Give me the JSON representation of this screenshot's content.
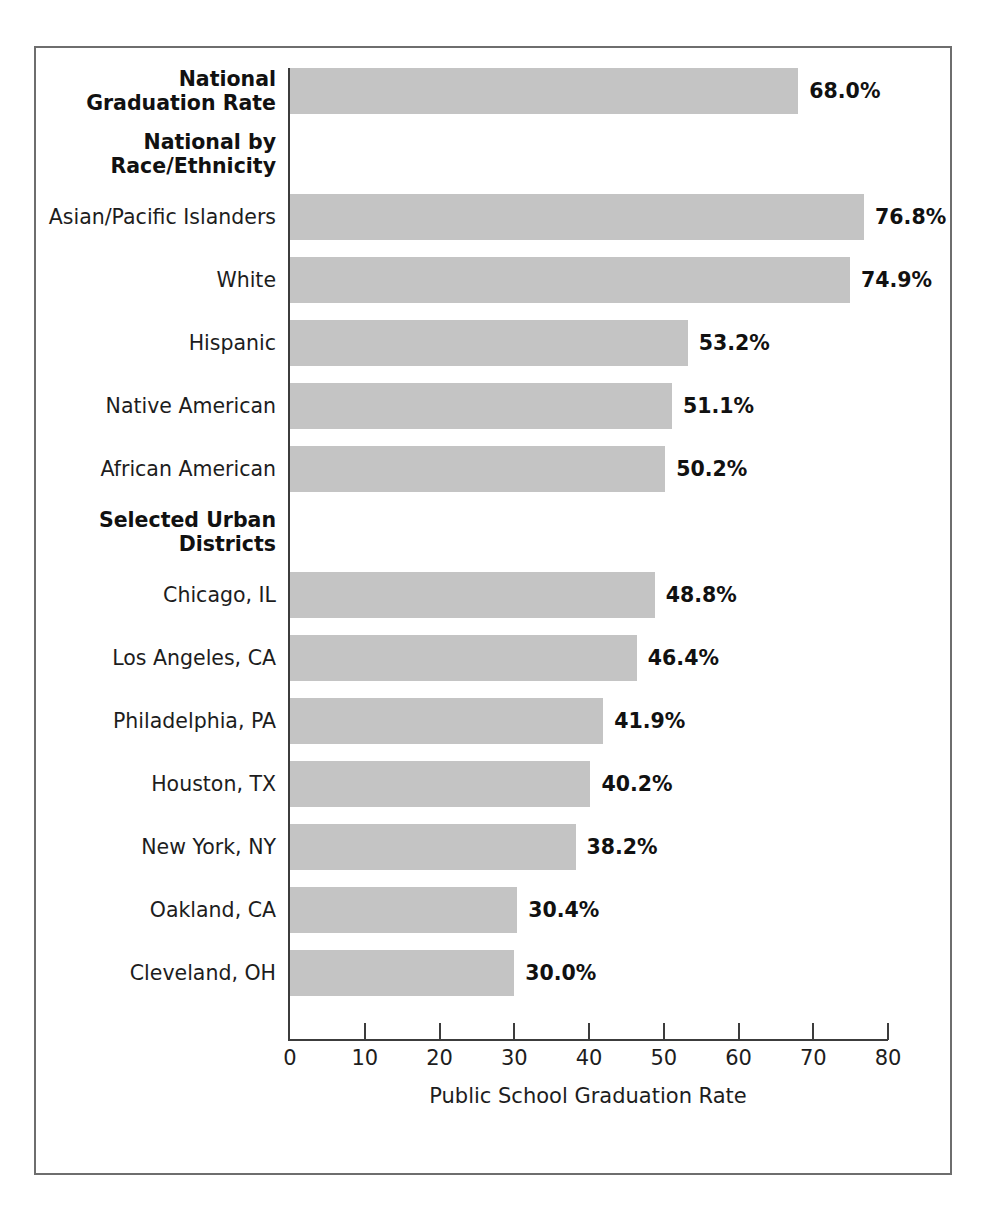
{
  "chart_data": {
    "type": "bar",
    "orientation": "horizontal",
    "title": "",
    "xlabel": "Public School Graduation Rate",
    "ylabel": "",
    "xlim": [
      0,
      80
    ],
    "xticks": [
      0,
      10,
      20,
      30,
      40,
      50,
      60,
      70,
      80
    ],
    "xtick_labels": [
      "0",
      "10",
      "20",
      "30",
      "40",
      "50",
      "60",
      "70",
      "80"
    ],
    "grid": false,
    "legend": false,
    "bar_color": "#c4c4c4",
    "categories": [
      "National Graduation Rate",
      "Asian/Pacific Islanders",
      "White",
      "Hispanic",
      "Native American",
      "African American",
      "Chicago, IL",
      "Los Angeles, CA",
      "Philadelphia, PA",
      "Houston, TX",
      "New York, NY",
      "Oakland, CA",
      "Cleveland, OH"
    ],
    "values": [
      68.0,
      76.8,
      74.9,
      53.2,
      51.1,
      50.2,
      48.8,
      46.4,
      41.9,
      40.2,
      38.2,
      30.4,
      30.0
    ],
    "value_labels": [
      "68.0%",
      "76.8%",
      "74.9%",
      "53.2%",
      "51.1%",
      "50.2%",
      "48.8%",
      "46.4%",
      "41.9%",
      "40.2%",
      "38.2%",
      "30.4%",
      "30.0%"
    ],
    "group_headers": [
      "National by Race/Ethnicity",
      "Selected Urban Districts"
    ]
  },
  "rows": [
    {
      "label": "National\nGraduation Rate",
      "kind": "bar",
      "bold": true,
      "lines": 2,
      "value": 68.0,
      "value_label": "68.0%"
    },
    {
      "label": "National by\nRace/Ethnicity",
      "kind": "header",
      "bold": true,
      "lines": 2,
      "value": null,
      "value_label": ""
    },
    {
      "label": "Asian/Pacific Islanders",
      "kind": "bar",
      "bold": false,
      "lines": 1,
      "value": 76.8,
      "value_label": "76.8%"
    },
    {
      "label": "White",
      "kind": "bar",
      "bold": false,
      "lines": 1,
      "value": 74.9,
      "value_label": "74.9%"
    },
    {
      "label": "Hispanic",
      "kind": "bar",
      "bold": false,
      "lines": 1,
      "value": 53.2,
      "value_label": "53.2%"
    },
    {
      "label": "Native American",
      "kind": "bar",
      "bold": false,
      "lines": 1,
      "value": 51.1,
      "value_label": "51.1%"
    },
    {
      "label": "African American",
      "kind": "bar",
      "bold": false,
      "lines": 1,
      "value": 50.2,
      "value_label": "50.2%"
    },
    {
      "label": "Selected Urban\nDistricts",
      "kind": "header",
      "bold": true,
      "lines": 2,
      "value": null,
      "value_label": ""
    },
    {
      "label": "Chicago, IL",
      "kind": "bar",
      "bold": false,
      "lines": 1,
      "value": 48.8,
      "value_label": "48.8%"
    },
    {
      "label": "Los Angeles, CA",
      "kind": "bar",
      "bold": false,
      "lines": 1,
      "value": 46.4,
      "value_label": "46.4%"
    },
    {
      "label": "Philadelphia, PA",
      "kind": "bar",
      "bold": false,
      "lines": 1,
      "value": 41.9,
      "value_label": "41.9%"
    },
    {
      "label": "Houston, TX",
      "kind": "bar",
      "bold": false,
      "lines": 1,
      "value": 40.2,
      "value_label": "40.2%"
    },
    {
      "label": "New York, NY",
      "kind": "bar",
      "bold": false,
      "lines": 1,
      "value": 38.2,
      "value_label": "38.2%"
    },
    {
      "label": "Oakland, CA",
      "kind": "bar",
      "bold": false,
      "lines": 1,
      "value": 30.4,
      "value_label": "30.4%"
    },
    {
      "label": "Cleveland, OH",
      "kind": "bar",
      "bold": false,
      "lines": 1,
      "value": 30.0,
      "value_label": "30.0%"
    }
  ],
  "axis": {
    "title": "Public School Graduation Rate",
    "ticks": [
      "0",
      "10",
      "20",
      "30",
      "40",
      "50",
      "60",
      "70",
      "80"
    ]
  }
}
